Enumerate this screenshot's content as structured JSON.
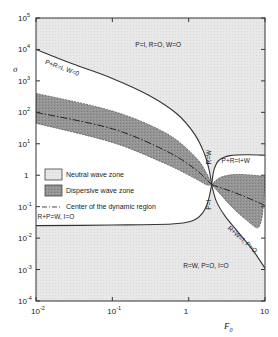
{
  "chart_data": {
    "type": "area",
    "title": "",
    "xlabel": "F",
    "xlabel_subscript": "0",
    "ylabel": "σ",
    "xscale": "log",
    "yscale": "log",
    "xlim": [
      0.01,
      10
    ],
    "ylim": [
      0.0001,
      100000
    ],
    "x_ticks": [
      {
        "value": 0.01,
        "base": "10",
        "exp": "-2"
      },
      {
        "value": 0.1,
        "base": "10",
        "exp": "-1"
      },
      {
        "value": 1,
        "base": "1",
        "exp": ""
      },
      {
        "value": 10,
        "base": "10",
        "exp": ""
      }
    ],
    "y_ticks": [
      {
        "value": 100000,
        "base": "10",
        "exp": "5"
      },
      {
        "value": 10000,
        "base": "10",
        "exp": "4"
      },
      {
        "value": 1000,
        "base": "10",
        "exp": "3"
      },
      {
        "value": 100,
        "base": "10",
        "exp": "2"
      },
      {
        "value": 10,
        "base": "10",
        "exp": "1"
      },
      {
        "value": 1,
        "base": "1",
        "exp": ""
      },
      {
        "value": 0.1,
        "base": "10",
        "exp": "-1"
      },
      {
        "value": 0.01,
        "base": "10",
        "exp": "-2"
      },
      {
        "value": 0.001,
        "base": "10",
        "exp": "-3"
      },
      {
        "value": 0.0001,
        "base": "10",
        "exp": "-4"
      }
    ],
    "grid": false,
    "legend": {
      "placement": "left-center",
      "entries": [
        {
          "label": "Neutral wave zone",
          "style": "light-fill"
        },
        {
          "label": "Dispersive wave zone",
          "style": "dark-fill"
        },
        {
          "label": "Center of the dynamic region",
          "style": "dash-dot-line"
        }
      ]
    },
    "pinch_point": {
      "F0": 2.0,
      "sigma": 0.5
    },
    "boundaries": [
      {
        "name": "P+R=I, W=0",
        "points": [
          [
            0.01,
            10000
          ],
          [
            0.03,
            3500
          ],
          [
            0.1,
            1200
          ],
          [
            0.3,
            350
          ],
          [
            0.7,
            90
          ],
          [
            1.2,
            20
          ],
          [
            1.6,
            5
          ],
          [
            1.85,
            1.5
          ],
          [
            2.0,
            0.5
          ]
        ]
      },
      {
        "name": "P+R=I+W",
        "points": [
          [
            2.0,
            0.5
          ],
          [
            2.15,
            1.5
          ],
          [
            2.5,
            3.0
          ],
          [
            3.5,
            4.2
          ],
          [
            6,
            4.5
          ],
          [
            10,
            4.3
          ]
        ]
      },
      {
        "name": "R+P=W, I=0",
        "points": [
          [
            0.01,
            0.025
          ],
          [
            0.1,
            0.026
          ],
          [
            0.6,
            0.028
          ],
          [
            1.1,
            0.035
          ],
          [
            1.5,
            0.06
          ],
          [
            1.8,
            0.15
          ],
          [
            2.0,
            0.5
          ]
        ]
      },
      {
        "name": "R+W=I, P=0",
        "points": [
          [
            2.0,
            0.5
          ],
          [
            2.3,
            0.15
          ],
          [
            3,
            0.05
          ],
          [
            4.5,
            0.015
          ],
          [
            7,
            0.004
          ],
          [
            10,
            0.0011
          ]
        ]
      }
    ],
    "zones": [
      {
        "name": "Neutral wave zone (upper)",
        "type": "neutral",
        "region": "above P+R=I, W=0 and P+R=I+W"
      },
      {
        "name": "Neutral wave zone (lower)",
        "type": "neutral",
        "region": "below R+P=W, I=0 and R+W=I, P=0"
      },
      {
        "name": "Dispersive wave zone (left)",
        "type": "dispersive",
        "upper": [
          [
            0.01,
            400
          ],
          [
            0.1,
            110
          ],
          [
            0.5,
            22
          ],
          [
            1.2,
            4
          ],
          [
            1.7,
            1.2
          ],
          [
            2.0,
            0.5
          ]
        ],
        "lower": [
          [
            0.01,
            45
          ],
          [
            0.1,
            11
          ],
          [
            0.5,
            2.3
          ],
          [
            1.2,
            0.8
          ],
          [
            1.7,
            0.5
          ],
          [
            2.0,
            0.5
          ]
        ],
        "center": [
          [
            0.01,
            100
          ],
          [
            0.1,
            30
          ],
          [
            0.5,
            6
          ],
          [
            1.2,
            1.6
          ],
          [
            2.0,
            0.5
          ]
        ]
      },
      {
        "name": "Dispersive wave zone (right)",
        "type": "dispersive",
        "upper": [
          [
            2.0,
            0.5
          ],
          [
            2.6,
            0.85
          ],
          [
            4,
            1.05
          ],
          [
            7,
            1.0
          ],
          [
            10,
            0.9
          ]
        ],
        "lower": [
          [
            2.0,
            0.5
          ],
          [
            2.6,
            0.25
          ],
          [
            4,
            0.08
          ],
          [
            7,
            0.025
          ],
          [
            10,
            0.012
          ]
        ],
        "center": [
          [
            2.0,
            0.5
          ],
          [
            4,
            0.28
          ],
          [
            7,
            0.16
          ],
          [
            10,
            0.11
          ]
        ]
      }
    ],
    "annotations": [
      {
        "text": "P+R=I, W=0",
        "F0": 0.013,
        "sigma": 3500,
        "rotate": 20
      },
      {
        "text": "P=I, R=O, W=O",
        "F0": 0.2,
        "sigma": 12000,
        "rotate": 0
      },
      {
        "text": "R=W",
        "F0": 1.95,
        "sigma": 2.2,
        "rotate": -90
      },
      {
        "text": "P+R=I+W",
        "F0": 2.7,
        "sigma": 2.5,
        "rotate": 0
      },
      {
        "text": "R+P=W, I=O",
        "F0": 0.0105,
        "sigma": 0.04,
        "rotate": 0
      },
      {
        "text": "P=I",
        "F0": 1.95,
        "sigma": 0.08,
        "rotate": -90
      },
      {
        "text": "R+W=I, P=O",
        "F0": 3.2,
        "sigma": 0.02,
        "rotate": 42
      },
      {
        "text": "R=W, P=O, I=O",
        "F0": 0.85,
        "sigma": 0.0011,
        "rotate": 0
      }
    ]
  },
  "colors": {
    "neutral_fill": "#e6e6e6",
    "dispersive_fill": "#8f8f8f",
    "line": "#333333",
    "background": "#ffffff"
  }
}
